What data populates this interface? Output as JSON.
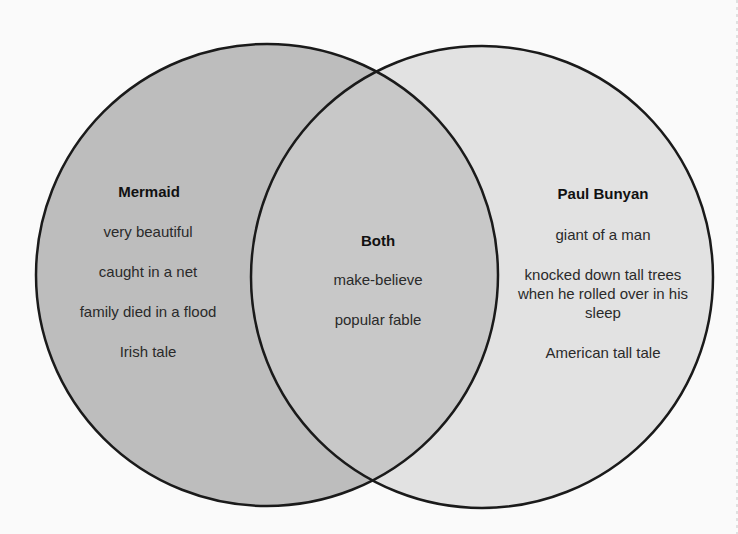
{
  "diagram": {
    "type": "venn",
    "colors": {
      "background": "#fafafa",
      "left_fill": "#bdbdbd",
      "right_fill": "#e2e2e2",
      "overlap_fill": "#c8c8c8",
      "stroke": "#1a1a1a"
    },
    "left": {
      "title": "Mermaid",
      "items": [
        "very beautiful",
        "caught in a net",
        "family died in a flood",
        "Irish tale"
      ]
    },
    "both": {
      "title": "Both",
      "items": [
        "make-believe",
        "popular fable"
      ]
    },
    "right": {
      "title": "Paul Bunyan",
      "items": [
        "giant of a man",
        "knocked down tall trees when he rolled over in his sleep",
        "American tall tale"
      ]
    }
  }
}
